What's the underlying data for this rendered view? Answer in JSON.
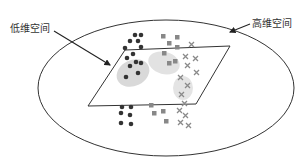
{
  "labels": {
    "low_dim": "低维空间",
    "high_dim": "高维空间"
  },
  "colors": {
    "outline": "#333333",
    "dot": "#333333",
    "square": "#888888",
    "cross": "#8a8a8a",
    "cluster": "#d9d9d9"
  },
  "legend_semantics": {
    "dots": "class-1 (circles)",
    "squares": "class-2 (squares)",
    "crosses": "class-3 (crosses)"
  }
}
